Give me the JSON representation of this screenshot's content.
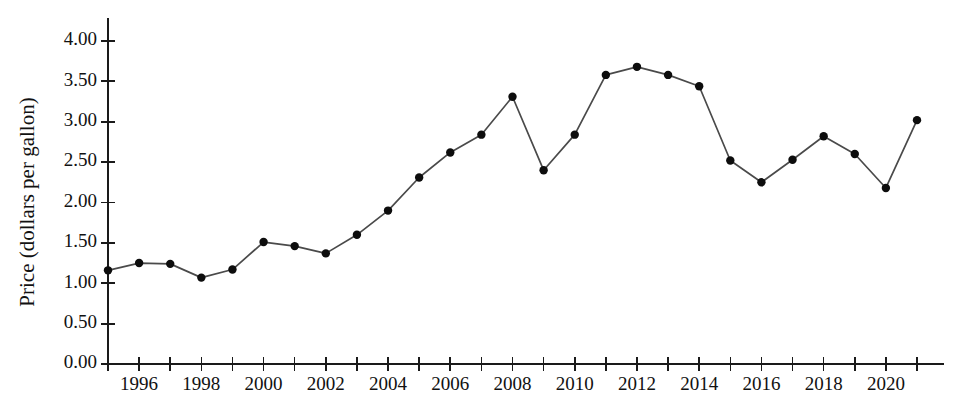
{
  "chart_data": {
    "type": "line",
    "title": "",
    "xlabel": "",
    "ylabel": "Price (dollars per gallon)",
    "xlim": [
      1995,
      2021
    ],
    "ylim": [
      0.0,
      4.0
    ],
    "grid": false,
    "legend": false,
    "legend_position": "none",
    "marker": "filled-circle",
    "line_color": "#4a4a4a",
    "marker_color": "#0d0d0d",
    "x": [
      1995,
      1996,
      1997,
      1998,
      1999,
      2000,
      2001,
      2002,
      2003,
      2004,
      2005,
      2006,
      2007,
      2008,
      2009,
      2010,
      2011,
      2012,
      2013,
      2014,
      2015,
      2016,
      2017,
      2018,
      2019,
      2020,
      2021
    ],
    "values": [
      1.16,
      1.25,
      1.24,
      1.07,
      1.17,
      1.51,
      1.46,
      1.37,
      1.6,
      1.9,
      2.31,
      2.62,
      2.84,
      3.31,
      2.4,
      2.84,
      3.58,
      3.68,
      3.58,
      3.44,
      2.52,
      2.25,
      2.53,
      2.82,
      2.6,
      2.18,
      3.02
    ],
    "y_ticks": [
      0.0,
      0.5,
      1.0,
      1.5,
      2.0,
      2.5,
      3.0,
      3.5,
      4.0
    ],
    "y_tick_labels": [
      "0.00",
      "0.50",
      "1.00",
      "1.50",
      "2.00",
      "2.50",
      "3.00",
      "3.50",
      "4.00"
    ],
    "x_ticks": [
      1995,
      1996,
      1997,
      1998,
      1999,
      2000,
      2001,
      2002,
      2003,
      2004,
      2005,
      2006,
      2007,
      2008,
      2009,
      2010,
      2011,
      2012,
      2013,
      2014,
      2015,
      2016,
      2017,
      2018,
      2019,
      2020,
      2021
    ],
    "x_tick_labels_shown": [
      {
        "value": 1996,
        "label": "1996"
      },
      {
        "value": 1998,
        "label": "1998"
      },
      {
        "value": 2000,
        "label": "2000"
      },
      {
        "value": 2002,
        "label": "2002"
      },
      {
        "value": 2004,
        "label": "2004"
      },
      {
        "value": 2006,
        "label": "2006"
      },
      {
        "value": 2008,
        "label": "2008"
      },
      {
        "value": 2010,
        "label": "2010"
      },
      {
        "value": 2012,
        "label": "2012"
      },
      {
        "value": 2014,
        "label": "2014"
      },
      {
        "value": 2016,
        "label": "2016"
      },
      {
        "value": 2018,
        "label": "2018"
      },
      {
        "value": 2020,
        "label": "2020"
      }
    ]
  }
}
